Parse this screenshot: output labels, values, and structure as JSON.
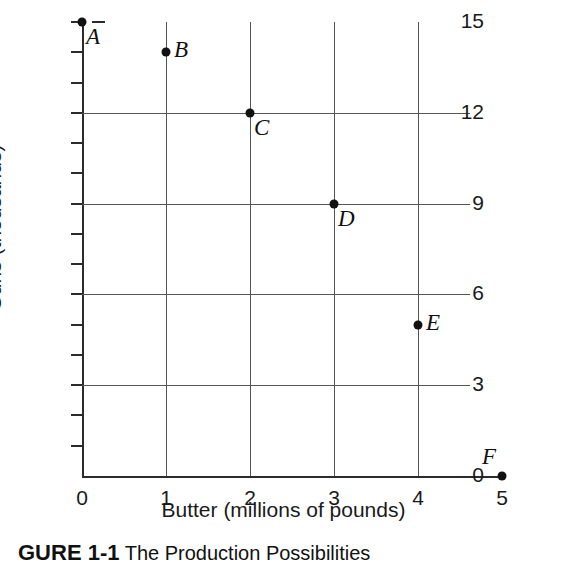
{
  "chart_data": {
    "type": "scatter",
    "title": "",
    "xlabel": "Butter (millions of pounds)",
    "ylabel": "Guns (thousands)",
    "xlim": [
      0,
      5
    ],
    "ylim": [
      0,
      15
    ],
    "grid": true,
    "legend": null,
    "x_ticks": [
      0,
      1,
      2,
      3,
      4,
      5
    ],
    "x_tick_labels": [
      "0",
      "1",
      "2",
      "3",
      "4",
      "5"
    ],
    "y_ticks": [
      0,
      1,
      2,
      3,
      4,
      5,
      6,
      7,
      8,
      9,
      10,
      11,
      12,
      13,
      14,
      15
    ],
    "y_tick_labels": [
      "0",
      "",
      "",
      "3",
      "",
      "",
      "6",
      "",
      "",
      "9",
      "",
      "",
      "12",
      "",
      "",
      "15"
    ],
    "y_labeled_ticks": [
      0,
      3,
      6,
      9,
      12,
      15
    ],
    "x_gridlines": [
      1,
      2,
      3,
      4
    ],
    "y_gridlines": [
      3,
      6,
      9,
      12
    ],
    "points": [
      {
        "label": "A",
        "x": 0,
        "y": 15,
        "label_pos": "below-right"
      },
      {
        "label": "B",
        "x": 1,
        "y": 14,
        "label_pos": "right"
      },
      {
        "label": "C",
        "x": 2,
        "y": 12,
        "label_pos": "below-right"
      },
      {
        "label": "D",
        "x": 3,
        "y": 9,
        "label_pos": "below-right"
      },
      {
        "label": "E",
        "x": 4,
        "y": 5,
        "label_pos": "right"
      },
      {
        "label": "F",
        "x": 5,
        "y": 0,
        "label_pos": "above-left"
      }
    ]
  },
  "caption": {
    "label": "GURE 1-1",
    "text": "The Production Possibilities"
  },
  "colors": {
    "axis": "#2b2b2b",
    "grid": "#555555",
    "point": "#111111",
    "text": "#1a1a1a",
    "background": "#ffffff"
  }
}
